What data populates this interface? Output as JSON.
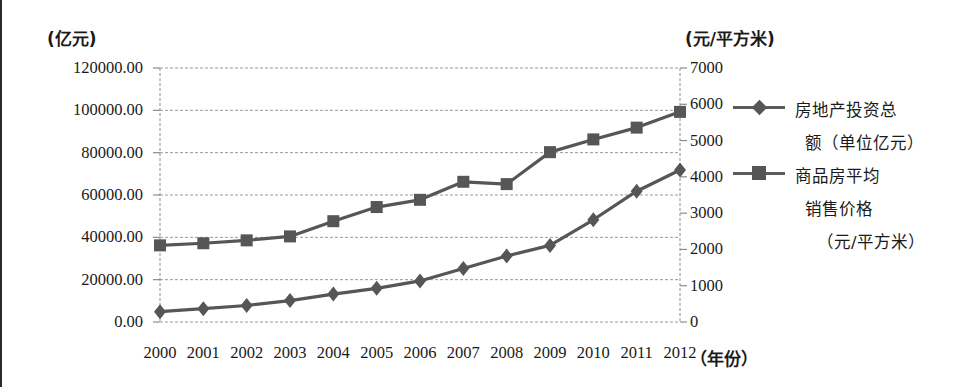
{
  "chart_data": {
    "type": "line",
    "title": "",
    "xlabel": "（年份）",
    "categories": [
      "2000",
      "2001",
      "2002",
      "2003",
      "2004",
      "2005",
      "2006",
      "2007",
      "2008",
      "2009",
      "2010",
      "2011",
      "2012"
    ],
    "grid": true,
    "legend_position": "right",
    "axes": {
      "left": {
        "unit_label": "(亿元)",
        "ticks": [
          "0.00",
          "20000.00",
          "40000.00",
          "60000.00",
          "80000.00",
          "100000.00",
          "120000.00"
        ],
        "tick_values": [
          0,
          20000,
          40000,
          60000,
          80000,
          100000,
          120000
        ],
        "ylim": [
          0,
          120000
        ]
      },
      "right": {
        "unit_label": "(元/平方米)",
        "ticks": [
          "0",
          "1000",
          "2000",
          "3000",
          "4000",
          "5000",
          "6000",
          "7000"
        ],
        "tick_values": [
          0,
          1000,
          2000,
          3000,
          4000,
          5000,
          6000,
          7000
        ],
        "ylim": [
          0,
          7000
        ]
      }
    },
    "series": [
      {
        "name": "房地产投资总额（单位亿元）",
        "legend_line1": "房地产投资总",
        "legend_line2": "额（单位亿元）",
        "marker": "diamond",
        "axis": "left",
        "color": "#565656",
        "values": [
          4900,
          6300,
          7800,
          10100,
          13200,
          15900,
          19400,
          25300,
          31200,
          36200,
          48300,
          61800,
          71800
        ]
      },
      {
        "name": "商品房平均销售价格（元/平方米）",
        "legend_line1": "商品房平均",
        "legend_line2": "销售价格",
        "legend_line3": "（元/平方米）",
        "marker": "square",
        "axis": "right",
        "color": "#565656",
        "values": [
          2112,
          2170,
          2250,
          2359,
          2778,
          3168,
          3367,
          3864,
          3800,
          4681,
          5032,
          5357,
          5791
        ]
      }
    ]
  },
  "colors": {
    "line": "#5c5c5c",
    "grid": "#9a9a9a",
    "frame": "#8c8c8c",
    "text": "#1a1a1a"
  }
}
